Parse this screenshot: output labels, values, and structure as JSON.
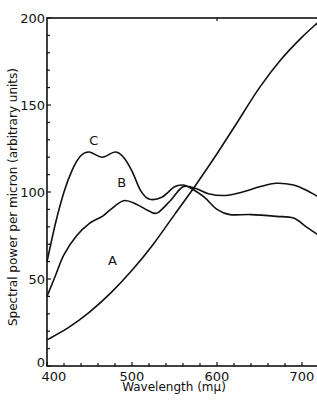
{
  "chart_data": {
    "type": "line",
    "title": "",
    "xlabel": "Wavelength (mμ)",
    "ylabel": "Spectral power per micron (arbitrary units)",
    "xlim": [
      400,
      722
    ],
    "ylim": [
      0,
      200
    ],
    "x_ticks": [
      400,
      500,
      600,
      700
    ],
    "y_ticks": [
      0,
      50,
      100,
      150,
      200
    ],
    "x_tick_labels": [
      "400",
      "500",
      "600",
      "700"
    ],
    "y_tick_labels": [
      "0",
      "50",
      "100",
      "150",
      "200"
    ],
    "grid": false,
    "legend": "inline curve labels",
    "series": [
      {
        "name": "A",
        "label_pos": [
          477,
          58
        ],
        "x": [
          400,
          425,
          450,
          475,
          500,
          525,
          550,
          575,
          600,
          625,
          650,
          675,
          700,
          720
        ],
        "values": [
          15,
          22,
          31,
          42,
          55,
          70,
          87,
          104,
          122,
          141,
          160,
          176,
          189,
          198
        ]
      },
      {
        "name": "B",
        "label_pos": [
          488,
          103
        ],
        "x": [
          400,
          410,
          420,
          435,
          450,
          465,
          475,
          490,
          505,
          520,
          530,
          545,
          560,
          575,
          590,
          610,
          630,
          650,
          670,
          690,
          705,
          720
        ],
        "values": [
          40,
          52,
          64,
          75,
          82,
          86,
          90,
          95,
          93,
          89,
          88,
          95,
          103,
          102,
          99,
          98,
          100,
          103,
          105,
          104,
          101,
          97
        ]
      },
      {
        "name": "C",
        "label_pos": [
          455,
          127
        ],
        "x": [
          400,
          410,
          420,
          430,
          440,
          450,
          465,
          480,
          490,
          500,
          510,
          520,
          535,
          550,
          560,
          570,
          585,
          600,
          615,
          640,
          670,
          690,
          705,
          720
        ],
        "values": [
          60,
          82,
          100,
          113,
          121,
          123,
          120,
          123,
          120,
          112,
          101,
          96,
          97,
          103,
          104,
          102,
          97,
          90,
          87,
          87,
          86,
          85,
          80,
          75
        ]
      }
    ]
  }
}
